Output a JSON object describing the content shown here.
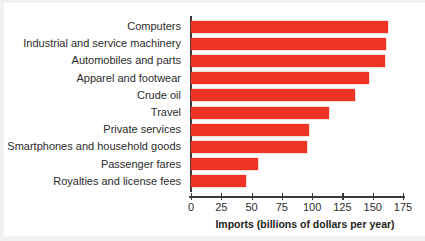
{
  "chart_data": {
    "type": "bar",
    "orientation": "horizontal",
    "title": "",
    "xlabel": "Imports (billions of dollars per year)",
    "ylabel": "",
    "xlim": [
      0,
      175
    ],
    "xticks": [
      0,
      25,
      50,
      75,
      100,
      125,
      150,
      175
    ],
    "grid": false,
    "legend": null,
    "bar_color": "#ee3424",
    "axis_color": "#3a3a3a",
    "categories": [
      "Computers",
      "Industrial and service machinery",
      "Automobiles and parts",
      "Apparel and footwear",
      "Crude oil",
      "Travel",
      "Private services",
      "Smartphones and household goods",
      "Passenger fares",
      "Royalties and license fees"
    ],
    "values": [
      163,
      161,
      160,
      147,
      135,
      114,
      97,
      96,
      55,
      45
    ],
    "series": [
      {
        "name": "Imports",
        "values": [
          163,
          161,
          160,
          147,
          135,
          114,
          97,
          96,
          55,
          45
        ]
      }
    ]
  }
}
